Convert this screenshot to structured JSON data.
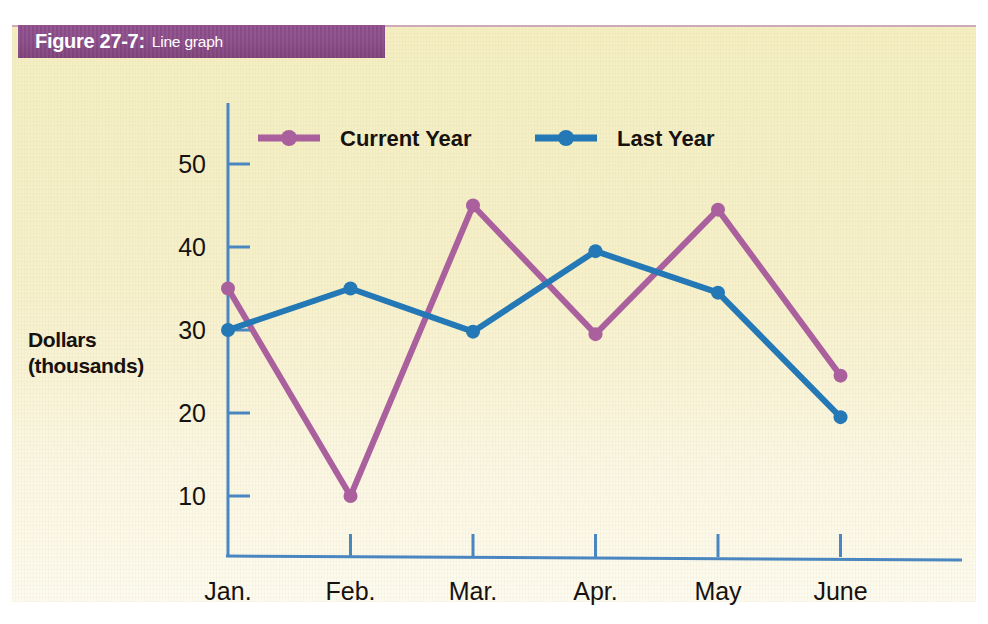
{
  "figure": {
    "number": "Figure 27-7:",
    "caption": "Line graph",
    "banner_color": "#8a4b88",
    "panel_color": "#f5efc6"
  },
  "chart_data": {
    "type": "line",
    "title": "",
    "xlabel": "",
    "ylabel": "Dollars\n(thousands)",
    "ylabel_line1": "Dollars",
    "ylabel_line2": "(thousands)",
    "categories": [
      "Jan.",
      "Feb.",
      "Mar.",
      "Apr.",
      "May",
      "June"
    ],
    "yticks": [
      10,
      20,
      30,
      40,
      50
    ],
    "ytick_labels": [
      "10",
      "20",
      "30",
      "40",
      "50"
    ],
    "ylim": [
      0,
      57
    ],
    "grid": false,
    "legend_position": "top-center",
    "series": [
      {
        "name": "Current Year",
        "color": "#a9609d",
        "marker": "circle",
        "values": [
          35,
          10,
          45,
          29.5,
          44.5,
          24.5
        ]
      },
      {
        "name": "Last Year",
        "color": "#2378b5",
        "marker": "circle",
        "values": [
          30,
          35,
          29.8,
          39.5,
          34.5,
          19.5
        ]
      }
    ],
    "axis_color": "#4a86c0"
  }
}
